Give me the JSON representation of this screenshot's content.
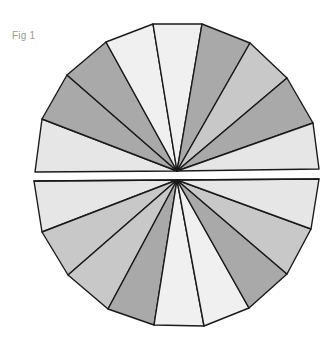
{
  "figure": {
    "label": "Fig 1",
    "colors": {
      "light": "#e6e6e6",
      "pale": "#f0f0f0",
      "mid": "#c8c8c8",
      "dark": "#a9a9a9",
      "stroke": "#1a1a1a"
    },
    "top_half": {
      "center": [
        177,
        171
      ],
      "wedges": [
        {
          "name": "wedge-top-1",
          "points": [
            [
              35,
              172
            ],
            [
              42,
              119
            ]
          ],
          "shade": "light"
        },
        {
          "name": "wedge-top-2",
          "points": [
            [
              42,
              119
            ],
            [
              67,
              75
            ]
          ],
          "shade": "dark"
        },
        {
          "name": "wedge-top-3",
          "points": [
            [
              67,
              75
            ],
            [
              106,
              42
            ]
          ],
          "shade": "dark"
        },
        {
          "name": "wedge-top-4",
          "points": [
            [
              106,
              42
            ],
            [
              153,
              24
            ]
          ],
          "shade": "pale"
        },
        {
          "name": "wedge-top-5",
          "points": [
            [
              153,
              24
            ],
            [
              202,
              24
            ]
          ],
          "shade": "pale"
        },
        {
          "name": "wedge-top-6",
          "points": [
            [
              202,
              24
            ],
            [
              250,
              43
            ]
          ],
          "shade": "dark"
        },
        {
          "name": "wedge-top-7",
          "points": [
            [
              250,
              43
            ],
            [
              287,
              78
            ]
          ],
          "shade": "mid"
        },
        {
          "name": "wedge-top-8",
          "points": [
            [
              287,
              78
            ],
            [
              313,
              123
            ]
          ],
          "shade": "dark"
        },
        {
          "name": "wedge-top-9",
          "points": [
            [
              313,
              123
            ],
            [
              319,
              169
            ]
          ],
          "shade": "light"
        }
      ]
    },
    "bottom_half": {
      "center": [
        177,
        180
      ],
      "wedges": [
        {
          "name": "wedge-bottom-1",
          "points": [
            [
              34,
              181
            ],
            [
              42,
              232
            ]
          ],
          "shade": "light"
        },
        {
          "name": "wedge-bottom-2",
          "points": [
            [
              42,
              232
            ],
            [
              68,
              275
            ]
          ],
          "shade": "mid"
        },
        {
          "name": "wedge-bottom-3",
          "points": [
            [
              68,
              275
            ],
            [
              108,
              309
            ]
          ],
          "shade": "mid"
        },
        {
          "name": "wedge-bottom-4",
          "points": [
            [
              108,
              309
            ],
            [
              154,
              325
            ]
          ],
          "shade": "dark"
        },
        {
          "name": "wedge-bottom-5",
          "points": [
            [
              154,
              325
            ],
            [
              204,
              326
            ]
          ],
          "shade": "pale"
        },
        {
          "name": "wedge-bottom-6",
          "points": [
            [
              204,
              326
            ],
            [
              249,
              308
            ]
          ],
          "shade": "pale"
        },
        {
          "name": "wedge-bottom-7",
          "points": [
            [
              249,
              308
            ],
            [
              287,
              274
            ]
          ],
          "shade": "dark"
        },
        {
          "name": "wedge-bottom-8",
          "points": [
            [
              287,
              274
            ],
            [
              311,
              229
            ]
          ],
          "shade": "mid"
        },
        {
          "name": "wedge-bottom-9",
          "points": [
            [
              311,
              229
            ],
            [
              319,
              179
            ]
          ],
          "shade": "light"
        },
        {
          "name": "wedge-bottom-top",
          "points": [
            [
              319,
              179
            ],
            [
              34,
              181
            ]
          ],
          "shade": "light"
        }
      ]
    }
  }
}
